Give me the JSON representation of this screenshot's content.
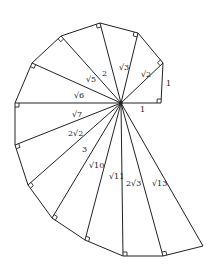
{
  "diagram": {
    "center": [
      121,
      103
    ],
    "vertices": [
      [
        161,
        103
      ],
      [
        163,
        63
      ],
      [
        138,
        33
      ],
      [
        100,
        23
      ],
      [
        61,
        36
      ],
      [
        32,
        63
      ],
      [
        15,
        103
      ],
      [
        15,
        145
      ],
      [
        28,
        185
      ],
      [
        52,
        218
      ],
      [
        85,
        240
      ],
      [
        123,
        256
      ],
      [
        163,
        256
      ],
      [
        203,
        246
      ]
    ],
    "right_angle_markers": [
      [
        161,
        103
      ],
      [
        163,
        63
      ],
      [
        138,
        33
      ],
      [
        100,
        23
      ],
      [
        61,
        36
      ],
      [
        32,
        63
      ],
      [
        15,
        103
      ],
      [
        15,
        145
      ],
      [
        28,
        185
      ],
      [
        52,
        218
      ],
      [
        85,
        240
      ],
      [
        123,
        256
      ],
      [
        163,
        256
      ]
    ],
    "labels": [
      {
        "text": "1",
        "x": 140,
        "y": 106,
        "name": "label-base-1"
      },
      {
        "text": "1",
        "x": 166,
        "y": 80,
        "name": "label-leg-1"
      },
      {
        "text": "√2",
        "x": 141,
        "y": 71,
        "name": "label-sqrt2"
      },
      {
        "text": "√3",
        "x": 119,
        "y": 64,
        "name": "label-sqrt3"
      },
      {
        "text": "2",
        "x": 102,
        "y": 70,
        "name": "label-2"
      },
      {
        "text": "√5",
        "x": 86,
        "y": 76,
        "name": "label-sqrt5"
      },
      {
        "text": "√6",
        "x": 74,
        "y": 92,
        "name": "label-sqrt6"
      },
      {
        "text": "√7",
        "x": 72,
        "y": 111,
        "name": "label-sqrt7"
      },
      {
        "text": "2√2",
        "x": 68,
        "y": 130,
        "name": "label-2sqrt2"
      },
      {
        "text": "3",
        "x": 82,
        "y": 146,
        "name": "label-3"
      },
      {
        "text": "√10",
        "x": 89,
        "y": 162,
        "name": "label-sqrt10"
      },
      {
        "text": "√11",
        "x": 109,
        "y": 173,
        "name": "label-sqrt11"
      },
      {
        "text": "2√3",
        "x": 126,
        "y": 180,
        "name": "label-2sqrt3"
      },
      {
        "text": "√13",
        "x": 152,
        "y": 180,
        "name": "label-sqrt13"
      }
    ],
    "stroke_color": "#222222"
  }
}
